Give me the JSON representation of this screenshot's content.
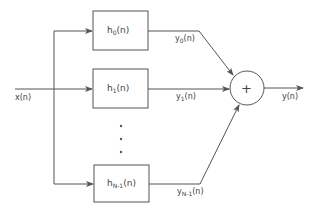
{
  "diagram": {
    "type": "filter-bank-block-diagram",
    "input": {
      "label": "x(n)"
    },
    "output": {
      "label": "y(n)"
    },
    "summer": {
      "symbol": "+"
    },
    "filters": [
      {
        "name": "h",
        "sub": "0",
        "arg": "(n)",
        "out_name": "y",
        "out_sub": "0",
        "out_arg": "(n)"
      },
      {
        "name": "h",
        "sub": "1",
        "arg": "(n)",
        "out_name": "y",
        "out_sub": "1",
        "out_arg": "(n)"
      },
      {
        "name": "h",
        "sub": "N-1",
        "arg": "(n)",
        "out_name": "y",
        "out_sub": "N-1",
        "out_arg": "(n)"
      }
    ],
    "ellipsis": "• • •",
    "colors": {
      "stroke": "#555555",
      "background": "#ffffff"
    }
  }
}
